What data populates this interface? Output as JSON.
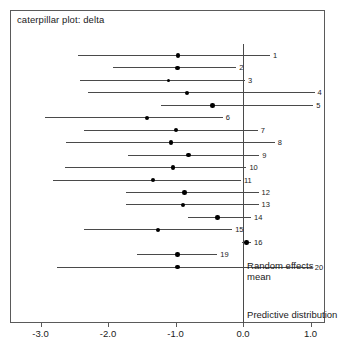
{
  "chart_data": {
    "type": "scatter",
    "title": "caterpillar plot: delta",
    "xlabel": "",
    "ylabel": "",
    "xlim": [
      -3.45,
      1.2
    ],
    "grid": false,
    "legend": null,
    "reference_line_x": 0.0,
    "xticks": [
      -3.0,
      -2.0,
      -1.0,
      0.0,
      1.0
    ],
    "xtick_labels": [
      "-3.0",
      "-2.0",
      "-1.0",
      "0.0",
      "1.0"
    ],
    "annotations": [
      {
        "text": "Random effects mean",
        "x": 0.06,
        "y_row": 17
      },
      {
        "text": "Predictive distribution",
        "x": 0.06,
        "y_row": 21
      }
    ],
    "categories": [
      "1",
      "2",
      "3",
      "4",
      "5",
      "6",
      "7",
      "8",
      "9",
      "10",
      "11",
      "12",
      "13",
      "14",
      "15",
      "16",
      "19",
      "20"
    ],
    "points": [
      {
        "label": "1",
        "estimate": -0.96,
        "lower": -2.44,
        "upper": 0.4
      },
      {
        "label": "2",
        "estimate": -0.97,
        "lower": -1.93,
        "upper": -0.1
      },
      {
        "label": "3",
        "estimate": -1.11,
        "lower": -2.41,
        "upper": 0.03
      },
      {
        "label": "4",
        "estimate": -0.83,
        "lower": -2.3,
        "upper": 1.06
      },
      {
        "label": "5",
        "estimate": -0.45,
        "lower": -1.21,
        "upper": 1.04
      },
      {
        "label": "6",
        "estimate": -1.42,
        "lower": -2.94,
        "upper": -0.3
      },
      {
        "label": "7",
        "estimate": -0.99,
        "lower": -2.35,
        "upper": 0.22
      },
      {
        "label": "8",
        "estimate": -1.07,
        "lower": -2.62,
        "upper": 0.47
      },
      {
        "label": "9",
        "estimate": -0.81,
        "lower": -1.7,
        "upper": 0.24
      },
      {
        "label": "10",
        "estimate": -1.04,
        "lower": -2.63,
        "upper": 0.05
      },
      {
        "label": "11",
        "estimate": -1.33,
        "lower": -2.82,
        "upper": -0.03
      },
      {
        "label": "12",
        "estimate": -0.87,
        "lower": -1.73,
        "upper": 0.23
      },
      {
        "label": "13",
        "estimate": -0.89,
        "lower": -1.73,
        "upper": 0.23
      },
      {
        "label": "14",
        "estimate": -0.38,
        "lower": -0.82,
        "upper": 0.12
      },
      {
        "label": "15",
        "estimate": -1.26,
        "lower": -2.35,
        "upper": -0.16
      },
      {
        "label": "16",
        "estimate": 0.05,
        "lower": -0.02,
        "upper": 0.12
      },
      {
        "label": "19",
        "estimate": -0.97,
        "lower": -1.57,
        "upper": -0.38
      },
      {
        "label": "20",
        "estimate": -0.97,
        "lower": -2.76,
        "upper": 1.02
      }
    ]
  }
}
